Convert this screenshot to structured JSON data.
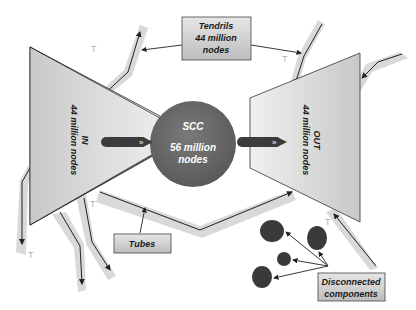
{
  "diagram": {
    "type": "bow-tie web graph structure",
    "scc": {
      "title": "SCC",
      "line1": "56 million",
      "line2": "nodes"
    },
    "in_component": {
      "title": "IN",
      "subtitle": "44 million nodes"
    },
    "out_component": {
      "title": "OUT",
      "subtitle": "44 million nodes"
    },
    "tendrils_box": {
      "line1": "Tendrils",
      "line2": "44 million",
      "line3": "nodes"
    },
    "tubes_box": {
      "label": "Tubes"
    },
    "disconnected_box": {
      "line1": "Disconnected",
      "line2": "components"
    },
    "tendril_marker": "T",
    "colors": {
      "triangle_fill": "#d6d6d6",
      "scc_fill": "#6e6e6e",
      "tube_band": "#d9d9d9",
      "label_box": "#cfcfcf",
      "disconnected_node": "#3a3a3a",
      "arrow_bar": "#3c3c3c"
    }
  }
}
